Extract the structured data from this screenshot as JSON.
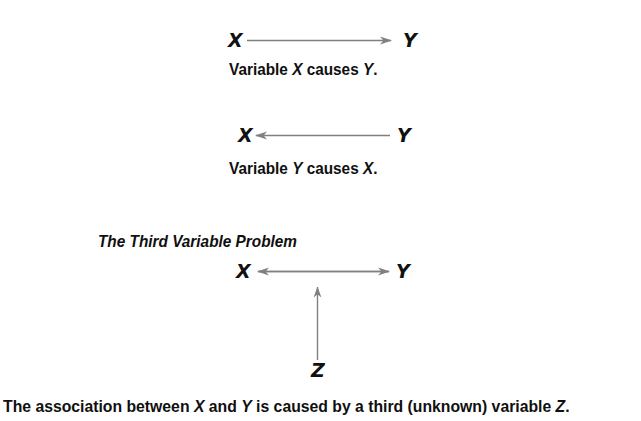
{
  "figure": {
    "background_color": "#ffffff",
    "text_color": "#101010",
    "arrow_color": "#808080",
    "panels": [
      {
        "id": "panel-x-causes-y",
        "left_node": "X",
        "right_node": "Y",
        "arrow_direction": "right",
        "caption_parts": [
          "Variable ",
          "X",
          " causes ",
          "Y",
          "."
        ],
        "caption_text": "Variable X causes Y."
      },
      {
        "id": "panel-y-causes-x",
        "left_node": "X",
        "right_node": "Y",
        "arrow_direction": "left",
        "caption_parts": [
          "Variable ",
          "Y",
          " causes ",
          "X",
          "."
        ],
        "caption_text": "Variable Y causes X."
      },
      {
        "id": "panel-third-variable",
        "title": "The Third Variable Problem",
        "left_node": "X",
        "right_node": "Y",
        "bottom_node": "Z",
        "arrow_direction": "both",
        "vertical_arrow_direction": "up"
      }
    ],
    "bottom_caption": {
      "full_text": "The association between X and Y is caused by a third (unknown) variable Z.",
      "p1": "The association between ",
      "v1": "X",
      "p2": " and ",
      "v2": "Y",
      "p3": " is caused by a third (unknown) variable ",
      "v3": "Z",
      "p4": "."
    }
  }
}
